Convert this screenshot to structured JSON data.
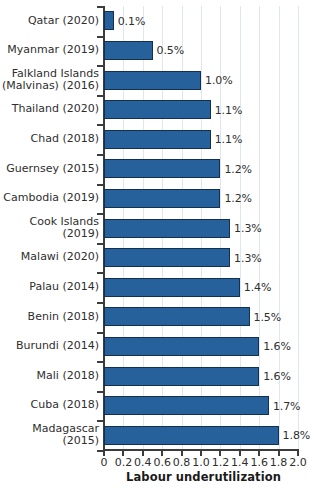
{
  "chart_data": {
    "type": "bar",
    "orientation": "horizontal",
    "title": "",
    "subtitle": "",
    "xlabel": "Labour underutilization",
    "ylabel": "",
    "xlim": [
      0,
      2.0
    ],
    "xticks": [
      "0",
      "0.2",
      "0.4",
      "0.6",
      "0.8",
      "1.0",
      "1.2",
      "1.4",
      "1.6",
      "1.8",
      "2.0"
    ],
    "xtick_values": [
      0,
      0.2,
      0.4,
      0.6,
      0.8,
      1.0,
      1.2,
      1.4,
      1.6,
      1.8,
      2.0
    ],
    "grid": "vertical",
    "legend": "none",
    "bar_color": "#26619c",
    "bar_edge_color": "#14304f",
    "grid_color": "#dfe6ee",
    "axis_color": "#3c3c3c",
    "text_color": "#2e2e2e",
    "categories": [
      "Qatar (2020)",
      "Myanmar (2019)",
      "Falkland Islands\n(Malvinas) (2016)",
      "Thailand (2020)",
      "Chad (2018)",
      "Guernsey (2015)",
      "Cambodia (2019)",
      "Cook Islands (2019)",
      "Malawi (2020)",
      "Palau (2014)",
      "Benin (2018)",
      "Burundi (2014)",
      "Mali (2018)",
      "Cuba (2018)",
      "Madagascar (2015)"
    ],
    "values": [
      0.1,
      0.5,
      1.0,
      1.1,
      1.1,
      1.2,
      1.2,
      1.3,
      1.3,
      1.4,
      1.5,
      1.6,
      1.6,
      1.7,
      1.8
    ],
    "value_labels": [
      "0.1%",
      "0.5%",
      "1.0%",
      "1.1%",
      "1.1%",
      "1.2%",
      "1.2%",
      "1.3%",
      "1.3%",
      "1.4%",
      "1.5%",
      "1.6%",
      "1.6%",
      "1.7%",
      "1.8%"
    ]
  }
}
